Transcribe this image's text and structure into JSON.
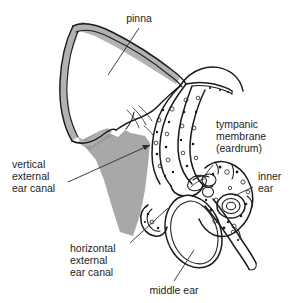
{
  "diagram": {
    "background_color": "#ffffff",
    "ink_color": "#1a1a1a",
    "shade_color": "#a8a8a8",
    "cartilage_color": "#b0b0b0",
    "text_color": "#1d1d1d"
  },
  "labels": {
    "pinna": {
      "lines": [
        "pinna"
      ],
      "line1": "pinna"
    },
    "tympanic_membrane": {
      "lines": [
        "tympanic",
        "membrane",
        "(eardrum)"
      ],
      "line1": "tympanic",
      "line2": "membrane",
      "line3": "(eardrum)"
    },
    "inner_ear": {
      "lines": [
        "inner",
        "ear"
      ],
      "line1": "inner",
      "line2": "ear"
    },
    "vertical_external_ear_canal": {
      "lines": [
        "vertical",
        "external",
        "ear canal"
      ],
      "line1": "vertical",
      "line2": "external",
      "line3": "ear canal"
    },
    "horizontal_external_ear_canal": {
      "lines": [
        "horizontal",
        "external",
        "ear canal"
      ],
      "line1": "horizontal",
      "line2": "external",
      "line3": "ear canal"
    },
    "middle_ear": {
      "lines": [
        "middle ear"
      ],
      "line1": "middle ear"
    }
  }
}
